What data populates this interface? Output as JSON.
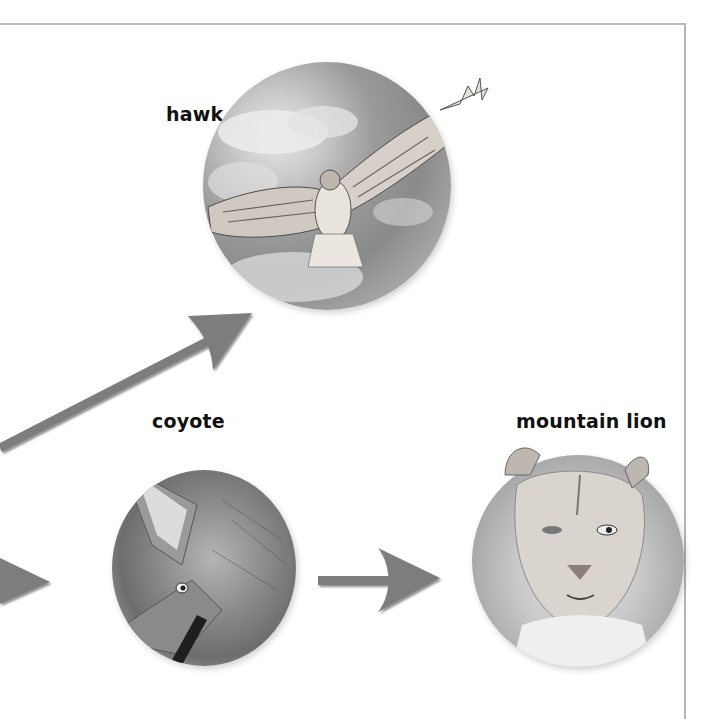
{
  "diagram": {
    "type": "food-chain",
    "organisms": [
      {
        "id": "hawk",
        "label": "hawk"
      },
      {
        "id": "coyote",
        "label": "coyote"
      },
      {
        "id": "mountain_lion",
        "label": "mountain lion"
      }
    ],
    "arrows": [
      {
        "from": "offscreen-left",
        "to": "hawk",
        "direction": "up-right"
      },
      {
        "from": "offscreen-left",
        "to": "coyote",
        "direction": "right"
      },
      {
        "from": "coyote",
        "to": "mountain_lion",
        "direction": "right"
      }
    ],
    "colors": {
      "arrow": "#7d7d7d",
      "arrow_shadow": "#2e2e2e",
      "frame": "#bdbdbd",
      "label": "#111111"
    }
  },
  "labels": {
    "hawk": "hawk",
    "coyote": "coyote",
    "mountain_lion": "mountain lion"
  }
}
